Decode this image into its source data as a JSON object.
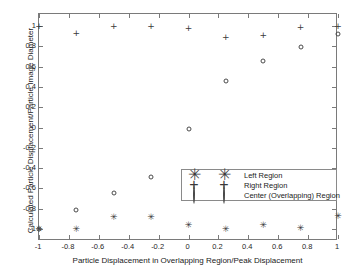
{
  "chart_data": {
    "type": "scatter",
    "title": "",
    "xlabel": "Particle Displacement in Overlapping Region/Peak Displacement",
    "ylabel": "Calculated Particle Displacement/Particle Image Diameter",
    "xlim": [
      -1,
      1
    ],
    "ylim": [
      -1.12,
      1.12
    ],
    "xticks": [
      -1,
      -0.8,
      -0.6,
      -0.4,
      -0.2,
      0,
      0.2,
      0.4,
      0.6,
      0.8,
      1
    ],
    "xticklabels": [
      "-1",
      "-0.8",
      "-0.6",
      "-0.4",
      "-0.2",
      "0",
      "0.2",
      "0.4",
      "0.6",
      "0.8",
      "1"
    ],
    "yticks": [
      -1,
      -0.8,
      -0.6,
      -0.4,
      -0.2,
      0,
      0.2,
      0.4,
      0.6,
      0.8,
      1
    ],
    "yticklabels": [
      "-1",
      "-0.8",
      "-0.6",
      "-0.4",
      "-0.2",
      "0",
      "0.2",
      "0.4",
      "0.6",
      "0.8",
      "1"
    ],
    "grid": false,
    "legend_position": "center-right",
    "series": [
      {
        "name": "Left Region",
        "marker": "asterisk",
        "color": "#3a3a3a",
        "points": [
          {
            "x": -1.0,
            "y": -1.0
          },
          {
            "x": -0.75,
            "y": -1.0
          },
          {
            "x": -0.5,
            "y": -0.885
          },
          {
            "x": -0.25,
            "y": -0.885
          },
          {
            "x": 0.0,
            "y": -0.965
          },
          {
            "x": 0.25,
            "y": -1.0
          },
          {
            "x": 0.5,
            "y": -0.965
          },
          {
            "x": 0.75,
            "y": -0.99
          },
          {
            "x": 1.0,
            "y": -0.875
          }
        ]
      },
      {
        "name": "Right Region",
        "marker": "plus",
        "color": "#3a3a3a",
        "points": [
          {
            "x": -1.0,
            "y": 1.0
          },
          {
            "x": -0.75,
            "y": 0.935
          },
          {
            "x": -0.5,
            "y": 1.0
          },
          {
            "x": -0.25,
            "y": 1.005
          },
          {
            "x": 0.0,
            "y": 0.985
          },
          {
            "x": 0.25,
            "y": 0.89
          },
          {
            "x": 0.5,
            "y": 0.91
          },
          {
            "x": 0.75,
            "y": 0.99
          },
          {
            "x": 1.0,
            "y": 1.0
          }
        ]
      },
      {
        "name": "Center (Overlapping) Region",
        "marker": "circle",
        "color": "#4a4a4a",
        "points": [
          {
            "x": -1.0,
            "y": -1.0
          },
          {
            "x": -0.75,
            "y": -0.81
          },
          {
            "x": -0.5,
            "y": -0.65
          },
          {
            "x": -0.25,
            "y": -0.487
          },
          {
            "x": 0.0,
            "y": -0.012
          },
          {
            "x": 0.25,
            "y": 0.46
          },
          {
            "x": 0.5,
            "y": 0.66
          },
          {
            "x": 0.75,
            "y": 0.79
          },
          {
            "x": 1.0,
            "y": 0.925
          }
        ]
      }
    ]
  },
  "legend": {
    "entries": [
      {
        "label": "Left Region",
        "symbol": "asterisk"
      },
      {
        "label": "Right Region",
        "symbol": "plus"
      },
      {
        "label": "Center (Overlapping) Region",
        "symbol": "circle"
      }
    ]
  }
}
